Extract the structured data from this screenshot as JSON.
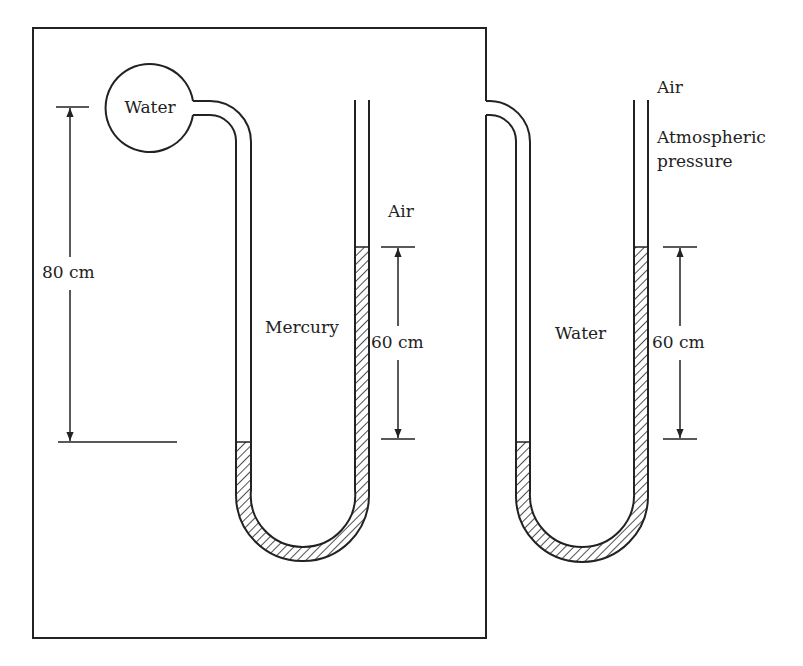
{
  "diagram": {
    "type": "two-u-tube-manometers",
    "colors": {
      "stroke": "#222222",
      "background": "#ffffff"
    },
    "bulb": {
      "label": "Water"
    },
    "left_manometer": {
      "fluid_label": "Mercury",
      "top_label": "Air",
      "height_label": "60 cm"
    },
    "right_manometer": {
      "fluid_label": "Water",
      "top_label": "Air",
      "pressure_label_line1": "Atmospheric",
      "pressure_label_line2": "pressure",
      "height_label": "60 cm"
    },
    "bulb_height_label": "80 cm"
  }
}
